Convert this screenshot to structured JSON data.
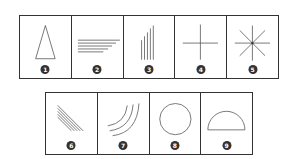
{
  "figure": {
    "top_row": [
      {
        "number": "1",
        "shape": "triangle-icon"
      },
      {
        "number": "2",
        "shape": "horizontal-lines-icon"
      },
      {
        "number": "3",
        "shape": "vertical-lines-icon"
      },
      {
        "number": "4",
        "shape": "cross-icon"
      },
      {
        "number": "5",
        "shape": "asterisk-icon"
      }
    ],
    "bottom_row": [
      {
        "number": "6",
        "shape": "diagonal-lines-icon"
      },
      {
        "number": "7",
        "shape": "arcs-icon"
      },
      {
        "number": "8",
        "shape": "circle-icon"
      },
      {
        "number": "9",
        "shape": "semicircle-icon"
      }
    ],
    "colors": {
      "stroke": "#555555",
      "border": "#333333",
      "badge": "#333333"
    }
  }
}
